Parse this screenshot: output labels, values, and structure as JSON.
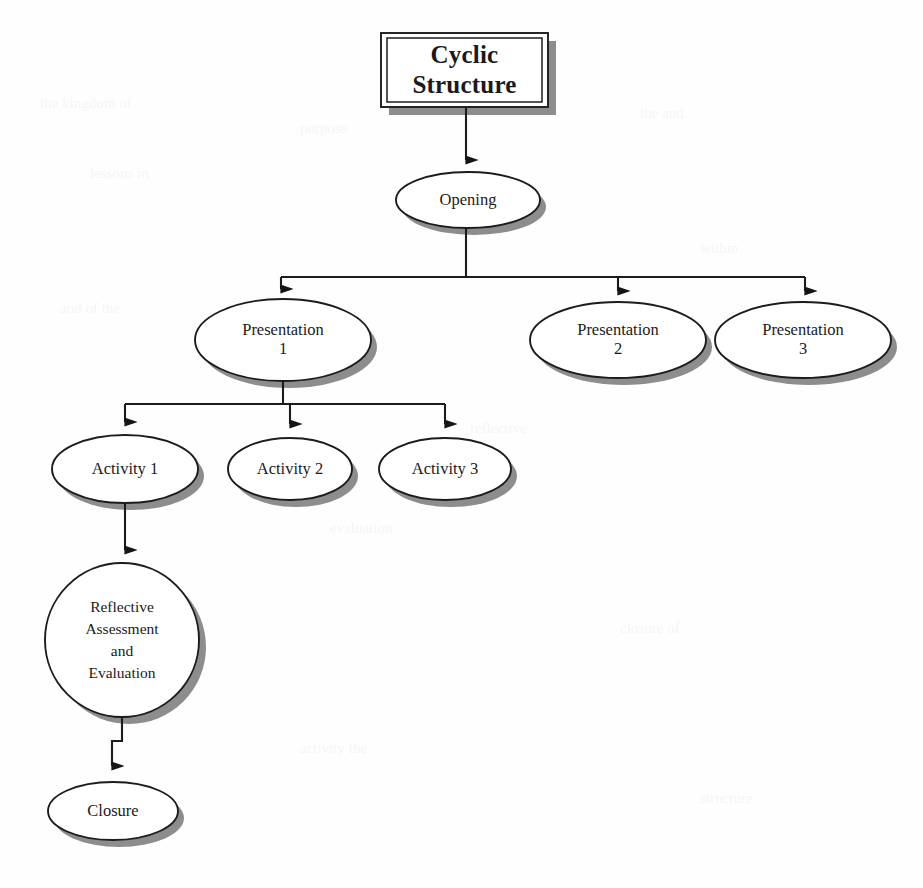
{
  "diagram": {
    "type": "flowchart",
    "orientation": "top-down-tree",
    "title_box": {
      "text": "Cyclic\nStructure",
      "shape": "rectangle-double-border-with-shadow",
      "x": 381,
      "y": 33,
      "width": 167,
      "height": 74
    },
    "nodes": [
      {
        "id": "opening",
        "label": "Opening",
        "shape": "ellipse",
        "cx": 468,
        "cy": 200,
        "rx": 72,
        "ry": 28,
        "level": 1
      },
      {
        "id": "presentation1",
        "label": "Presentation\n1",
        "shape": "ellipse",
        "cx": 283,
        "cy": 340,
        "rx": 88,
        "ry": 41,
        "level": 2
      },
      {
        "id": "presentation2",
        "label": "Presentation\n2",
        "shape": "ellipse",
        "cx": 618,
        "cy": 340,
        "rx": 88,
        "ry": 38,
        "level": 2
      },
      {
        "id": "presentation3",
        "label": "Presentation\n3",
        "shape": "ellipse",
        "cx": 803,
        "cy": 340,
        "rx": 88,
        "ry": 38,
        "level": 2
      },
      {
        "id": "activity1",
        "label": "Activity 1",
        "shape": "ellipse",
        "cx": 125,
        "cy": 469,
        "rx": 73,
        "ry": 34,
        "level": 3
      },
      {
        "id": "activity2",
        "label": "Activity 2",
        "shape": "ellipse",
        "cx": 290,
        "cy": 469,
        "rx": 62,
        "ry": 31,
        "level": 3
      },
      {
        "id": "activity3",
        "label": "Activity 3",
        "shape": "ellipse",
        "cx": 445,
        "cy": 469,
        "rx": 66,
        "ry": 31,
        "level": 3
      },
      {
        "id": "reflective",
        "label": "Reflective\nAssessment\nand\nEvaluation",
        "shape": "circle",
        "cx": 122,
        "cy": 640,
        "rx": 77,
        "ry": 77,
        "level": 4
      },
      {
        "id": "closure",
        "label": "Closure",
        "shape": "ellipse",
        "cx": 113,
        "cy": 811,
        "rx": 65,
        "ry": 29,
        "level": 5
      }
    ],
    "edges": [
      {
        "from": "title_box",
        "to": "opening",
        "style": "straight-arrow"
      },
      {
        "from": "opening",
        "to": "presentation1",
        "style": "orthogonal-bus-arrow"
      },
      {
        "from": "opening",
        "to": "presentation2",
        "style": "orthogonal-bus-arrow"
      },
      {
        "from": "opening",
        "to": "presentation3",
        "style": "orthogonal-bus-arrow"
      },
      {
        "from": "presentation1",
        "to": "activity1",
        "style": "orthogonal-bus-arrow"
      },
      {
        "from": "presentation1",
        "to": "activity2",
        "style": "orthogonal-bus-arrow"
      },
      {
        "from": "presentation1",
        "to": "activity3",
        "style": "orthogonal-bus-arrow"
      },
      {
        "from": "activity1",
        "to": "reflective",
        "style": "straight-arrow"
      },
      {
        "from": "reflective",
        "to": "closure",
        "style": "stepped-arrow"
      }
    ],
    "colors": {
      "stroke": "#1c1c1c",
      "fill": "#ffffff",
      "shadow": "#8d8d8d",
      "text": "#1a1a1a",
      "background": "#fefefe"
    }
  }
}
